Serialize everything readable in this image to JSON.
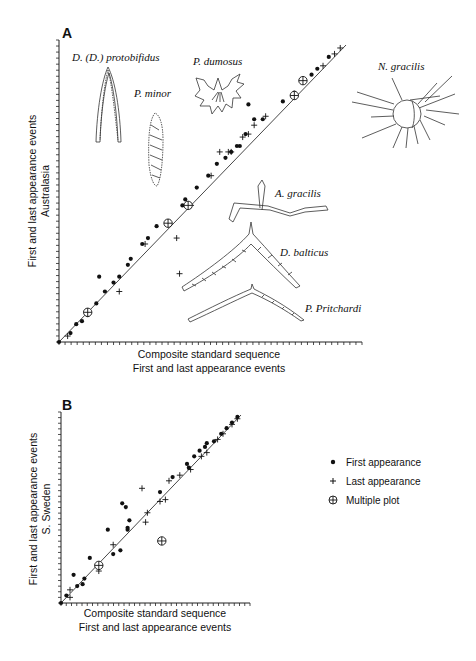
{
  "figure": {
    "panel_a": {
      "label": "A",
      "y_title_line1": "First and last appearance events",
      "y_title_line2": "Australasia",
      "x_title_line1": "Composite standard sequence",
      "x_title_line2": "First and last appearance events",
      "species_labels": [
        {
          "name": "D. (D.) protobifidus"
        },
        {
          "name": "P. minor"
        },
        {
          "name": "P. dumosus"
        },
        {
          "name": "N. gracilis"
        },
        {
          "name": "A. gracilis"
        },
        {
          "name": "D. balticus"
        },
        {
          "name": "P. Pritchardi"
        }
      ]
    },
    "panel_b": {
      "label": "B",
      "y_title_line1": "First and last appearance events",
      "y_title_line2": "S. Sweden",
      "x_title_line1": "Composite standard sequence",
      "x_title_line2": "First and last appearance events"
    },
    "legend": {
      "items": [
        {
          "symbol": "dot",
          "label": "First appearance"
        },
        {
          "symbol": "plus",
          "label": "Last appearance"
        },
        {
          "symbol": "circle-plus",
          "label": "Multiple plot"
        }
      ]
    },
    "colors": {
      "ink": "#111111",
      "background": "#ffffff"
    }
  },
  "chart_data": [
    {
      "type": "scatter",
      "title": "A",
      "xlabel": "Composite standard sequence — First and last appearance events",
      "ylabel": "First and last appearance events — Australasia",
      "xlim": [
        0,
        100
      ],
      "ylim": [
        0,
        100
      ],
      "grid": false,
      "line_of_correlation": {
        "x": [
          0,
          100
        ],
        "y": [
          0,
          100
        ]
      },
      "series": [
        {
          "name": "First appearance",
          "marker": "dot",
          "points": [
            [
              0,
              0
            ],
            [
              4,
              3
            ],
            [
              6,
              6
            ],
            [
              8,
              7
            ],
            [
              10,
              9
            ],
            [
              13,
              13
            ],
            [
              14,
              22
            ],
            [
              16,
              17
            ],
            [
              19,
              20
            ],
            [
              21,
              22
            ],
            [
              24,
              26
            ],
            [
              25,
              28
            ],
            [
              29,
              33
            ],
            [
              31,
              35
            ],
            [
              34,
              39
            ],
            [
              43,
              46
            ],
            [
              44,
              48
            ],
            [
              48,
              52
            ],
            [
              52,
              56
            ],
            [
              55,
              60
            ],
            [
              58,
              62
            ],
            [
              60,
              64
            ],
            [
              62,
              66
            ],
            [
              63,
              66
            ],
            [
              65,
              70
            ],
            [
              66,
              80
            ],
            [
              68,
              75
            ],
            [
              71,
              75
            ],
            [
              78,
              81
            ],
            [
              82,
              84
            ],
            [
              88,
              90
            ],
            [
              90,
              92
            ],
            [
              94,
              96
            ]
          ]
        },
        {
          "name": "Last appearance",
          "marker": "plus",
          "points": [
            [
              3,
              2
            ],
            [
              21,
              17
            ],
            [
              30,
              33
            ],
            [
              41,
              35
            ],
            [
              42,
              23
            ],
            [
              46,
              46
            ],
            [
              53,
              56
            ],
            [
              56,
              64
            ],
            [
              59,
              64
            ],
            [
              60,
              64
            ],
            [
              64,
              69
            ],
            [
              66,
              70
            ],
            [
              68,
              73
            ],
            [
              72,
              76
            ],
            [
              92,
              93
            ],
            [
              96,
              97
            ],
            [
              98,
              99
            ]
          ]
        },
        {
          "name": "Multiple plot",
          "marker": "circle-plus",
          "points": [
            [
              10,
              10
            ],
            [
              38,
              40
            ],
            [
              45,
              46
            ],
            [
              82,
              83
            ],
            [
              85,
              88
            ]
          ]
        }
      ]
    },
    {
      "type": "scatter",
      "title": "B",
      "xlabel": "Composite standard sequence — First and last appearance events",
      "ylabel": "First and last appearance events — S. Sweden",
      "xlim": [
        0,
        100
      ],
      "ylim": [
        0,
        100
      ],
      "grid": false,
      "line_of_correlation": {
        "x": [
          0,
          100
        ],
        "y": [
          0,
          100
        ]
      },
      "series": [
        {
          "name": "First appearance",
          "marker": "dot",
          "points": [
            [
              0,
              0
            ],
            [
              3,
              4
            ],
            [
              9,
              9
            ],
            [
              12,
              10
            ],
            [
              13,
              13
            ],
            [
              7,
              15
            ],
            [
              16,
              24
            ],
            [
              26,
              39
            ],
            [
              29,
              26
            ],
            [
              33,
              28
            ],
            [
              34,
              53
            ],
            [
              37,
              40
            ],
            [
              36,
              51
            ],
            [
              38,
              44
            ],
            [
              37,
              39
            ],
            [
              55,
              59
            ],
            [
              62,
              67
            ],
            [
              70,
              74
            ],
            [
              71,
              72
            ],
            [
              74,
              78
            ],
            [
              77,
              81
            ],
            [
              80,
              83
            ],
            [
              81,
              85
            ],
            [
              85,
              86
            ],
            [
              89,
              90
            ],
            [
              92,
              93
            ],
            [
              95,
              96
            ],
            [
              98,
              99
            ]
          ]
        },
        {
          "name": "Last appearance",
          "marker": "plus",
          "points": [
            [
              5,
              7
            ],
            [
              5,
              3
            ],
            [
              21,
              17
            ],
            [
              29,
              31
            ],
            [
              45,
              61
            ],
            [
              47,
              43
            ],
            [
              48,
              48
            ],
            [
              55,
              54
            ],
            [
              58,
              55
            ],
            [
              60,
              65
            ],
            [
              66,
              68
            ],
            [
              72,
              71
            ],
            [
              78,
              78
            ],
            [
              81,
              80
            ],
            [
              87,
              87
            ],
            [
              90,
              90
            ],
            [
              95,
              95
            ],
            [
              98,
              98
            ]
          ]
        },
        {
          "name": "Multiple plot",
          "marker": "circle-plus",
          "points": [
            [
              21,
              20
            ],
            [
              56,
              33
            ]
          ]
        }
      ]
    }
  ]
}
